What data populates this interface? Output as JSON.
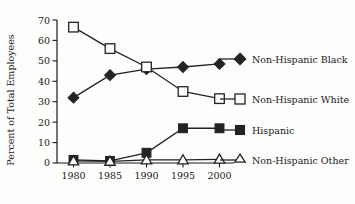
{
  "chart_data": {
    "type": "line",
    "title": "",
    "xlabel": "",
    "ylabel": "Percent of Total Employees",
    "categories": [
      "1980",
      "1985",
      "1990",
      "1995",
      "2000"
    ],
    "x": [
      1980,
      1985,
      1990,
      1995,
      2000
    ],
    "xlim": [
      1977.5,
      2002.5
    ],
    "ylim": [
      0,
      70
    ],
    "yticks": [
      0,
      10,
      20,
      30,
      40,
      50,
      60,
      70
    ],
    "ytick_labels": [
      "0",
      "10",
      "20",
      "30",
      "40",
      "50",
      "60",
      "70"
    ],
    "grid": false,
    "legend_position": "right",
    "series": [
      {
        "name": "Non-Hispanic Black",
        "marker": "filled-diamond",
        "color": "#232323",
        "values": [
          32,
          43,
          46,
          47,
          48.5
        ]
      },
      {
        "name": "Non-Hispanic White",
        "marker": "open-square",
        "color": "#232323",
        "values": [
          66.5,
          56,
          47,
          35,
          31.5
        ]
      },
      {
        "name": "Hispanic",
        "marker": "filled-square",
        "color": "#232323",
        "values": [
          1.5,
          1,
          5,
          17,
          17
        ]
      },
      {
        "name": "Non-Hispanic Other",
        "marker": "open-triangle",
        "color": "#232323",
        "values": [
          1,
          0.8,
          1.5,
          1.5,
          1.8
        ]
      }
    ]
  },
  "legend": {
    "entries": [
      {
        "label": "Non-Hispanic Black",
        "marker": "filled-diamond"
      },
      {
        "label": "Non-Hispanic White",
        "marker": "open-square"
      },
      {
        "label": "Hispanic",
        "marker": "filled-square"
      },
      {
        "label": "Non-Hispanic Other",
        "marker": "open-triangle"
      }
    ]
  },
  "axes": {
    "y_title": "Percent of Total Employees",
    "y_ticks": [
      "70",
      "60",
      "50",
      "40",
      "30",
      "20",
      "10",
      "0"
    ],
    "x_ticks": [
      "1980",
      "1985",
      "1990",
      "1995",
      "2000"
    ]
  },
  "colors": {
    "ink": "#232323",
    "background": "#fdfdfc"
  }
}
